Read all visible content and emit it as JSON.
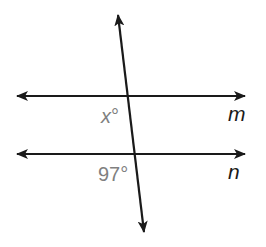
{
  "diagram": {
    "type": "parallel-lines-transversal",
    "lines": [
      {
        "id": "m",
        "label": "m",
        "y": 96
      },
      {
        "id": "n",
        "label": "n",
        "y": 154
      }
    ],
    "transversal": {
      "top": [
        118,
        15
      ],
      "bottom": [
        144,
        232
      ]
    },
    "angles": [
      {
        "id": "x",
        "var": "x",
        "degree_symbol": "°",
        "near_line": "m"
      },
      {
        "id": "known",
        "value": "97°",
        "near_line": "n"
      }
    ],
    "colors": {
      "stroke": "#1a1a1a",
      "angle_text": "#808080"
    }
  }
}
